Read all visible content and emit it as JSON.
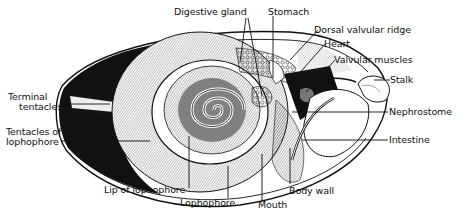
{
  "figure": {
    "colors": {
      "ink": "#111111",
      "paper": "#ffffff",
      "shade": "#222222"
    }
  },
  "labels": {
    "digestive_gland": "Digestive gland",
    "stomach": "Stomach",
    "dorsal_valvular_ridge": "Dorsal valvular ridge",
    "heart": "Heart",
    "valvular_muscles": "Valvular muscles",
    "stalk": "Stalk",
    "nephrostome": "Nephrostome",
    "intestine": "Intestine",
    "terminal_tentacles_1": "Terminal",
    "terminal_tentacles_2": "tentacles",
    "tentacles_of_lophophore_1": "Tentacles of",
    "tentacles_of_lophophore_2": "lophophore",
    "lip_of_lophophore": "Lip of lophophore",
    "lophophore": "Lophophore",
    "mouth": "Mouth",
    "body_wall": "Body wall"
  }
}
